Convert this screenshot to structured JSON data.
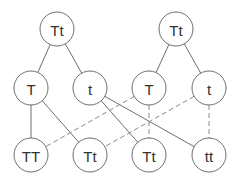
{
  "diagram": {
    "colors": {
      "stroke": "#6e6e6e",
      "dashed": "#8a8a8a",
      "text": "#333333",
      "fill": "#ffffff"
    },
    "radius": 17,
    "nodes": [
      {
        "id": "p1",
        "label": "Tt",
        "x": 57,
        "y": 29
      },
      {
        "id": "p2",
        "label": "Tt",
        "x": 176,
        "y": 29
      },
      {
        "id": "g1",
        "label": "T",
        "x": 31,
        "y": 88
      },
      {
        "id": "g2",
        "label": "t",
        "x": 90,
        "y": 88
      },
      {
        "id": "g3",
        "label": "T",
        "x": 149,
        "y": 88
      },
      {
        "id": "g4",
        "label": "t",
        "x": 209,
        "y": 88
      },
      {
        "id": "o1",
        "label": "TT",
        "x": 31,
        "y": 155
      },
      {
        "id": "o2",
        "label": "Tt",
        "x": 90,
        "y": 155
      },
      {
        "id": "o3",
        "label": "Tt",
        "x": 149,
        "y": 155
      },
      {
        "id": "o4",
        "label": "tt",
        "x": 209,
        "y": 155
      }
    ],
    "edges": [
      {
        "from": "p1",
        "to": "g1",
        "style": "solid"
      },
      {
        "from": "p1",
        "to": "g2",
        "style": "solid"
      },
      {
        "from": "p2",
        "to": "g3",
        "style": "solid"
      },
      {
        "from": "p2",
        "to": "g4",
        "style": "solid"
      },
      {
        "from": "g1",
        "to": "o1",
        "style": "solid"
      },
      {
        "from": "g1",
        "to": "o2",
        "style": "solid"
      },
      {
        "from": "g2",
        "to": "o3",
        "style": "solid"
      },
      {
        "from": "g2",
        "to": "o4",
        "style": "solid"
      },
      {
        "from": "g3",
        "to": "o1",
        "style": "dashed"
      },
      {
        "from": "g3",
        "to": "o3",
        "style": "dashed"
      },
      {
        "from": "g4",
        "to": "o2",
        "style": "dashed"
      },
      {
        "from": "g4",
        "to": "o4",
        "style": "dashed"
      }
    ]
  }
}
